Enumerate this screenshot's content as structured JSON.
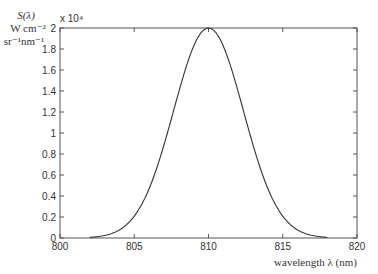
{
  "chart_data": {
    "type": "line",
    "title": "",
    "xlabel": "wavelength  λ (nm)",
    "ylabel": [
      "S(λ)",
      "W cm⁻²",
      "sr⁻¹nm⁻¹"
    ],
    "y_multiplier": "x 10⁴",
    "xlim": [
      800,
      820
    ],
    "ylim": [
      0,
      2
    ],
    "x_ticks": [
      800,
      805,
      810,
      815,
      820
    ],
    "x_tick_labels": [
      "800",
      "805",
      "810",
      "815",
      "820"
    ],
    "y_ticks": [
      0,
      0.2,
      0.4,
      0.6,
      0.8,
      1,
      1.2,
      1.4,
      1.6,
      1.8,
      2
    ],
    "y_tick_labels": [
      "0",
      "0.2",
      "0.4",
      "0.6",
      "0.8",
      "1",
      "1.2",
      "1.4",
      "1.6",
      "1.8",
      "2"
    ],
    "grid": false,
    "legend": null,
    "series": [
      {
        "name": "S(λ)",
        "color": "#333333",
        "shape": "gaussian",
        "center": 810,
        "peak": 2.0,
        "sigma": 2.35,
        "x_range": [
          802,
          818
        ],
        "x": [
          802,
          803,
          804,
          805,
          806,
          807,
          808,
          809,
          810,
          811,
          812,
          813,
          814,
          815,
          816,
          817,
          818
        ],
        "values": [
          0.01,
          0.024,
          0.077,
          0.207,
          0.47,
          0.885,
          1.391,
          1.827,
          2.0,
          1.827,
          1.391,
          0.885,
          0.47,
          0.207,
          0.077,
          0.024,
          0.01
        ]
      }
    ]
  }
}
